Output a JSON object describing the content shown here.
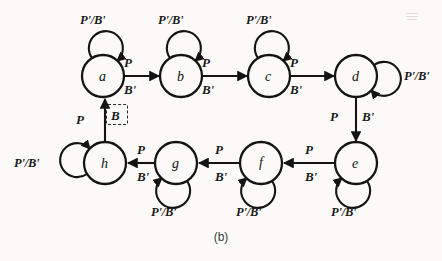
{
  "figure": {
    "caption": "(b)",
    "type": "state-transition-diagram",
    "ink_color": "#141414",
    "background_color": "#fbfaf8"
  },
  "states": [
    {
      "id": "a",
      "label": "a",
      "cx": 103,
      "cy": 76,
      "r": 21
    },
    {
      "id": "b",
      "label": "b",
      "cx": 181,
      "cy": 76,
      "r": 21
    },
    {
      "id": "c",
      "label": "c",
      "cx": 269,
      "cy": 76,
      "r": 21
    },
    {
      "id": "d",
      "label": "d",
      "cx": 356,
      "cy": 76,
      "r": 21
    },
    {
      "id": "e",
      "label": "e",
      "cx": 356,
      "cy": 163,
      "r": 21
    },
    {
      "id": "f",
      "label": "f",
      "cx": 261,
      "cy": 163,
      "r": 21
    },
    {
      "id": "g",
      "label": "g",
      "cx": 176,
      "cy": 163,
      "r": 21
    },
    {
      "id": "h",
      "label": "h",
      "cx": 105,
      "cy": 163,
      "r": 21
    }
  ],
  "self_loops": [
    {
      "state": "a",
      "side": "top",
      "label": "P'/B'",
      "label_x": 80,
      "label_y": 14
    },
    {
      "state": "b",
      "side": "top",
      "label": "P'/B'",
      "label_x": 158,
      "label_y": 14
    },
    {
      "state": "c",
      "side": "top",
      "label": "P'/B'",
      "label_x": 246,
      "label_y": 14
    },
    {
      "state": "d",
      "side": "right",
      "label": "P'/B'",
      "label_x": 404,
      "label_y": 70
    },
    {
      "state": "e",
      "side": "bottom",
      "label": "P'/B'",
      "label_x": 331,
      "label_y": 206
    },
    {
      "state": "f",
      "side": "bottom",
      "label": "P'/B'",
      "label_x": 236,
      "label_y": 206
    },
    {
      "state": "g",
      "side": "bottom",
      "label": "P'/B'",
      "label_x": 151,
      "label_y": 206
    },
    {
      "state": "h",
      "side": "left",
      "label": "P'/B'",
      "label_x": 14,
      "label_y": 157
    }
  ],
  "transitions": [
    {
      "from": "a",
      "to": "b",
      "input_label": "P",
      "output_label": "B'",
      "input_x": 124,
      "input_y": 56,
      "output_x": 124,
      "output_y": 83
    },
    {
      "from": "b",
      "to": "c",
      "input_label": "P",
      "output_label": "B'",
      "input_x": 202,
      "input_y": 56,
      "output_x": 202,
      "output_y": 83
    },
    {
      "from": "c",
      "to": "d",
      "input_label": "P",
      "output_label": "B'",
      "input_x": 290,
      "input_y": 56,
      "output_x": 290,
      "output_y": 83
    },
    {
      "from": "d",
      "to": "e",
      "input_label": "P",
      "output_label": "B'",
      "input_x": 330,
      "input_y": 110,
      "output_x": 362,
      "output_y": 110
    },
    {
      "from": "e",
      "to": "f",
      "input_label": "P",
      "output_label": "B'",
      "input_x": 305,
      "input_y": 143,
      "output_x": 305,
      "output_y": 170
    },
    {
      "from": "f",
      "to": "g",
      "input_label": "P",
      "output_label": "B'",
      "input_x": 215,
      "input_y": 143,
      "output_x": 215,
      "output_y": 170
    },
    {
      "from": "g",
      "to": "h",
      "input_label": "P",
      "output_label": "B'",
      "input_x": 137,
      "input_y": 143,
      "output_x": 137,
      "output_y": 170
    },
    {
      "from": "h",
      "to": "a",
      "input_label": "P",
      "output_label": "B",
      "input_x": 76,
      "input_y": 113,
      "output_x": 112,
      "output_y": 112,
      "output_highlighted": true
    }
  ],
  "highlight": {
    "label": "B",
    "box_x": 106,
    "box_y": 104,
    "box_w": 22,
    "box_h": 21,
    "style": "dashed"
  }
}
